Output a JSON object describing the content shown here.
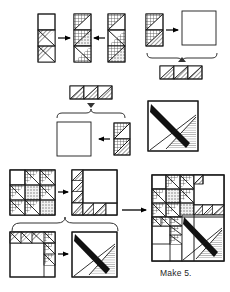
{
  "document": {
    "kind": "quilt-block-assembly-diagram",
    "caption": "Make 5.",
    "caption_position": {
      "x": 160,
      "y": 272
    }
  },
  "colors": {
    "outline": "#1a1a1a",
    "background": "#ffffff",
    "dark_fabric": "#111111",
    "hatch_fabric": "#555555",
    "dot_fabric": "#808080",
    "arrow": "#000000",
    "brace": "#333333"
  },
  "legend": {
    "fabrics": [
      {
        "name": "white-fabric",
        "fill": "plain-white"
      },
      {
        "name": "diagonal-hatch-fabric",
        "fill": "diagonal-lines"
      },
      {
        "name": "dotted-fabric",
        "fill": "stipple-dots"
      },
      {
        "name": "solid-dark-fabric",
        "fill": "solid-black"
      }
    ]
  },
  "steps": [
    {
      "id": "step-1",
      "name": "row-assembly-top-left",
      "description": "Three vertical strips joined into one pieced column",
      "pieces": [
        {
          "name": "left-column-strip",
          "cells": 3
        },
        {
          "name": "center-column-strip",
          "cells": 3
        },
        {
          "name": "right-column-strip",
          "cells": 3
        }
      ],
      "arrows": [
        {
          "name": "arrow-right-into-center",
          "direction": "right"
        },
        {
          "name": "arrow-left-into-center",
          "direction": "left"
        }
      ]
    },
    {
      "id": "step-2",
      "name": "corner-unit-top-right",
      "description": "Two-patch column joined to a large plain square, braced to a three-unit row",
      "pieces": [
        {
          "name": "two-patch-column",
          "cells": 2
        },
        {
          "name": "large-plain-square",
          "cells": 1
        },
        {
          "name": "three-unit-row",
          "cells": 3
        }
      ],
      "arrows": [
        {
          "name": "arrow-to-square",
          "direction": "right"
        }
      ],
      "braces": [
        {
          "name": "brace-down-to-row",
          "direction": "down"
        }
      ]
    },
    {
      "id": "step-3",
      "name": "center-unit-assembly",
      "description": "Three-unit row braced above a plain square joined to a two-patch column, producing a dark-bar corner block",
      "pieces": [
        {
          "name": "three-unit-row",
          "cells": 3
        },
        {
          "name": "large-plain-square",
          "cells": 1
        },
        {
          "name": "two-patch-column",
          "cells": 2
        },
        {
          "name": "dark-bar-corner-block",
          "cells": 1
        }
      ],
      "arrows": [
        {
          "name": "arrow-left-into-square",
          "direction": "left"
        }
      ],
      "braces": [
        {
          "name": "brace-down-from-row",
          "direction": "down"
        }
      ]
    },
    {
      "id": "step-4",
      "name": "quadrant-top",
      "description": "Pieced triangle grid joined into an L-shaped quadrant with open square",
      "pieces": [
        {
          "name": "pieced-triangle-grid",
          "cells": 9
        },
        {
          "name": "l-shaped-quadrant",
          "cells": 1
        }
      ],
      "arrows": [
        {
          "name": "arrow-to-quadrant",
          "direction": "right"
        }
      ]
    },
    {
      "id": "step-5",
      "name": "quadrant-bottom",
      "description": "Stair-step triangle quadrant joined into a dark-bar corner block",
      "pieces": [
        {
          "name": "stair-step-quadrant",
          "cells": 1
        },
        {
          "name": "dark-bar-corner-block",
          "cells": 1
        }
      ],
      "arrows": [
        {
          "name": "arrow-to-corner-block",
          "direction": "right"
        }
      ],
      "braces": [
        {
          "name": "brace-up-joining-quadrants",
          "direction": "up"
        }
      ]
    },
    {
      "id": "step-6",
      "name": "final-block",
      "description": "Completed pieced quilt block",
      "pieces": [
        {
          "name": "finished-quilt-block",
          "cells": 1
        }
      ],
      "arrows": [
        {
          "name": "arrow-to-final-block",
          "direction": "right"
        }
      ]
    }
  ]
}
